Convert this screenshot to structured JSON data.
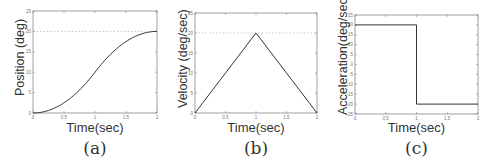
{
  "chart_data": [
    {
      "type": "line",
      "panel": "(a)",
      "title": "",
      "xlabel": "Time(sec)",
      "ylabel": "Position (deg)",
      "xlim": [
        0,
        2
      ],
      "ylim": [
        0,
        25
      ],
      "xticks": [
        "0",
        "0.5",
        "1",
        "1.5",
        "2"
      ],
      "yticks": [
        "0",
        "5",
        "10",
        "15",
        "20",
        "25"
      ],
      "reference_line": {
        "y": 20,
        "style": "dotted"
      },
      "grid": false,
      "series": [
        {
          "name": "position",
          "x": [
            0,
            0.25,
            0.5,
            0.75,
            1.0,
            1.25,
            1.5,
            1.75,
            2.0
          ],
          "y": [
            0,
            0.625,
            2.5,
            5.625,
            10,
            14.375,
            17.5,
            19.375,
            20
          ]
        }
      ]
    },
    {
      "type": "line",
      "panel": "(b)",
      "title": "",
      "xlabel": "Time(sec)",
      "ylabel": "Velocity (deg/sec)",
      "xlim": [
        0,
        2
      ],
      "ylim": [
        0,
        25
      ],
      "xticks": [
        "0",
        "0.5",
        "1",
        "1.5",
        "2"
      ],
      "yticks": [
        "0",
        "5",
        "10",
        "15",
        "20",
        "25"
      ],
      "reference_line": {
        "y": 20,
        "style": "dotted"
      },
      "grid": false,
      "series": [
        {
          "name": "velocity",
          "x": [
            0,
            1,
            2
          ],
          "y": [
            0,
            20,
            0
          ]
        }
      ]
    },
    {
      "type": "line",
      "panel": "(c)",
      "title": "",
      "xlabel": "Time(sec)",
      "ylabel": "Acceleration(deg/sec^2)",
      "xlim": [
        0,
        2
      ],
      "ylim": [
        -25,
        25
      ],
      "xticks": [
        "0",
        "0.5",
        "1",
        "1.5",
        "2"
      ],
      "yticks": [
        "-25",
        "-20",
        "-15",
        "-10",
        "-5",
        "0",
        "5",
        "10",
        "15",
        "20",
        "25"
      ],
      "grid": false,
      "series": [
        {
          "name": "acceleration",
          "x": [
            0,
            1,
            1,
            2
          ],
          "y": [
            20,
            20,
            -20,
            -20
          ]
        }
      ]
    }
  ],
  "panels": {
    "a": {
      "caption": "(a)",
      "xlabel": "Time(sec)",
      "ylabel": "Position (deg)"
    },
    "b": {
      "caption": "(b)",
      "xlabel": "Time(sec)",
      "ylabel": "Velocity (deg/sec)"
    },
    "c": {
      "caption": "(c)",
      "xlabel": "Time(sec)",
      "ylabel_main": "Acceleration(deg/sec",
      "ylabel_sup": "2",
      "ylabel_close": ")"
    }
  },
  "colors": {
    "line": "#333333",
    "axes": "#888888",
    "reference": "#bbbbbb"
  }
}
